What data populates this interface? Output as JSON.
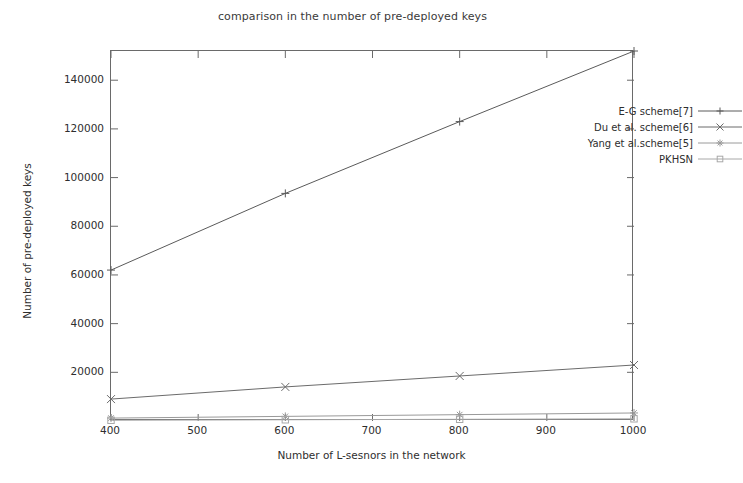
{
  "chart_data": {
    "type": "line",
    "title": "comparison in the number of pre-deployed keys",
    "xlabel": "Number of L-sesnors in the network",
    "ylabel": "Number of pre-deployed keys",
    "x": [
      400,
      600,
      800,
      1000
    ],
    "xlim": [
      400,
      1000
    ],
    "ylim": [
      0,
      152000
    ],
    "xticks": [
      400,
      500,
      600,
      700,
      800,
      900,
      1000
    ],
    "xtick_labels": [
      "400",
      "500",
      "600",
      "700",
      "800",
      "900",
      "1000"
    ],
    "yticks": [
      20000,
      40000,
      60000,
      80000,
      100000,
      120000,
      140000
    ],
    "ytick_labels": [
      "20000",
      "40000",
      "60000",
      "80000",
      "100000",
      "120000",
      "140000"
    ],
    "grid": false,
    "legend_position": "top-right-inside",
    "series": [
      {
        "name": "E-G scheme[7]",
        "marker": "plus-icon",
        "color": "#5a5a5a",
        "values": [
          62000,
          93500,
          123000,
          152000
        ]
      },
      {
        "name": "Du et al. scheme[6]",
        "marker": "cross-icon",
        "color": "#6b6b6b",
        "values": [
          9000,
          14000,
          18500,
          23000
        ]
      },
      {
        "name": "Yang et al.scheme[5]",
        "marker": "star-icon",
        "color": "#9a9a9a",
        "values": [
          1200,
          1900,
          2600,
          3300
        ]
      },
      {
        "name": "PKHSN",
        "marker": "square-icon",
        "color": "#a8a8a8",
        "values": [
          300,
          500,
          700,
          900
        ]
      }
    ]
  },
  "legend": {
    "items": [
      {
        "label": "E-G scheme[7]"
      },
      {
        "label": "Du et al. scheme[6]"
      },
      {
        "label": "Yang et al.scheme[5]"
      },
      {
        "label": "PKHSN"
      }
    ]
  }
}
